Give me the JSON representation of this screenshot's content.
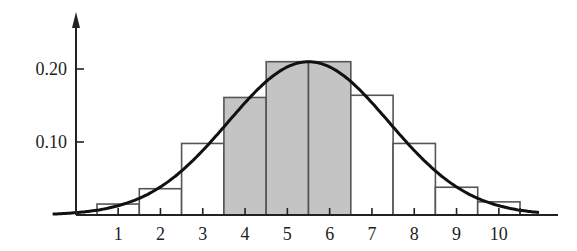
{
  "chart_data": {
    "type": "bar",
    "title": "",
    "xlabel": "",
    "ylabel": "",
    "categories": [
      "1",
      "2",
      "3",
      "4",
      "5",
      "6",
      "7",
      "8",
      "9",
      "10"
    ],
    "values": [
      0.015,
      0.036,
      0.098,
      0.161,
      0.21,
      0.21,
      0.164,
      0.098,
      0.038,
      0.018
    ],
    "shaded_categories": [
      "4",
      "5",
      "6"
    ],
    "x_ticks": [
      "1",
      "2",
      "3",
      "4",
      "5",
      "6",
      "7",
      "8",
      "9",
      "10"
    ],
    "y_ticks": [
      "0.10",
      "0.20"
    ],
    "y_tick_values": [
      0.1,
      0.2
    ],
    "ylim": [
      0,
      0.27
    ],
    "overlay_curve": {
      "type": "normal",
      "mean": 5.5,
      "sd": 1.9,
      "peak": 0.21
    },
    "grid": false,
    "colors": {
      "shaded": "#c4c4c4",
      "bar_edge": "#555555",
      "curve": "#111111",
      "axis": "#222222"
    }
  }
}
